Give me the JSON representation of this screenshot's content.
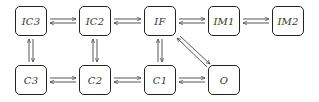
{
  "diagram": {
    "type": "state-transition-graph",
    "nodes": [
      {
        "id": "IC3",
        "label": "IC3",
        "row": 0,
        "col": 0
      },
      {
        "id": "IC2",
        "label": "IC2",
        "row": 0,
        "col": 1
      },
      {
        "id": "IF",
        "label": "IF",
        "row": 0,
        "col": 2
      },
      {
        "id": "IM1",
        "label": "IM1",
        "row": 0,
        "col": 3
      },
      {
        "id": "IM2",
        "label": "IM2",
        "row": 0,
        "col": 4
      },
      {
        "id": "C3",
        "label": "C3",
        "row": 1,
        "col": 0
      },
      {
        "id": "C2",
        "label": "C2",
        "row": 1,
        "col": 1
      },
      {
        "id": "C1",
        "label": "C1",
        "row": 1,
        "col": 2
      },
      {
        "id": "O",
        "label": "O",
        "row": 1,
        "col": 3
      }
    ],
    "edges": [
      {
        "a": "IC3",
        "b": "IC2",
        "direction": "bidirectional"
      },
      {
        "a": "IC2",
        "b": "IF",
        "direction": "bidirectional"
      },
      {
        "a": "IF",
        "b": "IM1",
        "direction": "bidirectional"
      },
      {
        "a": "IM1",
        "b": "IM2",
        "direction": "bidirectional"
      },
      {
        "a": "C3",
        "b": "C2",
        "direction": "bidirectional"
      },
      {
        "a": "C2",
        "b": "C1",
        "direction": "bidirectional"
      },
      {
        "a": "C1",
        "b": "O",
        "direction": "bidirectional"
      },
      {
        "a": "IC3",
        "b": "C3",
        "direction": "bidirectional"
      },
      {
        "a": "IC2",
        "b": "C2",
        "direction": "bidirectional"
      },
      {
        "a": "IF",
        "b": "C1",
        "direction": "bidirectional"
      },
      {
        "a": "IF",
        "b": "O",
        "direction": "bidirectional"
      }
    ]
  },
  "labels": {
    "IC3": "IC3",
    "IC2": "IC2",
    "IF": "IF",
    "IM1": "IM1",
    "IM2": "IM2",
    "C3": "C3",
    "C2": "C2",
    "C1": "C1",
    "O": "O"
  }
}
